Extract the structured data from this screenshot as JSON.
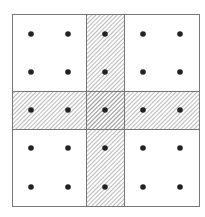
{
  "diagram": {
    "outer_box": {
      "x": 12.5,
      "y": 14.5,
      "width": 187,
      "height": 192
    },
    "vertical_band": {
      "x": 86.5,
      "width": 38
    },
    "horizontal_band": {
      "y": 91.5,
      "height": 38
    },
    "grid": {
      "rows": 5,
      "cols": 5
    },
    "dot_x": [
      31,
      68,
      105,
      143,
      180
    ],
    "dot_y": [
      34,
      72,
      110,
      148,
      187
    ],
    "dot_radius": 2.8,
    "colors": {
      "stroke": "#777777",
      "hatch": "#888888",
      "dot": "#222222",
      "background": "#ffffff"
    }
  }
}
